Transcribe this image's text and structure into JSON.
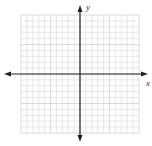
{
  "diagram": {
    "type": "coordinate-plane",
    "x_axis_label": "x",
    "y_axis_label": "y",
    "grid": {
      "cells_x": 20,
      "cells_y": 20,
      "left": 21,
      "top": 15,
      "cell_size": 5.9,
      "color": "#d9d9d9",
      "major_every": 5,
      "major_color": "#c4c4c4"
    },
    "axes": {
      "origin_x": 80,
      "origin_y": 74,
      "x_start": 4,
      "x_end": 148,
      "y_start": 5,
      "y_end": 142,
      "color": "#222222"
    }
  }
}
